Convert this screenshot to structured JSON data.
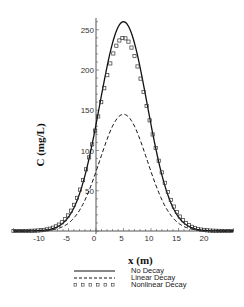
{
  "chart_data": {
    "type": "line",
    "title": "",
    "xlabel": "x (m)",
    "ylabel": "C (mg/L)",
    "xlim": [
      -15,
      25
    ],
    "ylim": [
      0,
      265
    ],
    "x_ticks": [
      -10,
      -5,
      0,
      5,
      10,
      15,
      20
    ],
    "y_ticks": [
      50,
      100,
      150,
      200,
      250
    ],
    "grid": false,
    "legend_position": "bottom",
    "series": [
      {
        "name": "No Decay",
        "style": "solid",
        "peak_x": 5,
        "peak_y": 260,
        "sigma": 4.3
      },
      {
        "name": "Linear Decay",
        "style": "dashed",
        "peak_x": 5,
        "peak_y": 145,
        "sigma": 4.3
      },
      {
        "name": "Nonlinear Decay",
        "style": "square-markers",
        "peak_x": 5,
        "peak_y": 240,
        "sigma": 4.5
      }
    ]
  },
  "axis": {
    "x_label": "x (m)",
    "y_label": "C (mg/L)",
    "x_tick_labels": [
      "-10",
      "-5",
      "0",
      "5",
      "10",
      "15",
      "20"
    ],
    "y_tick_labels": [
      "50",
      "100",
      "150",
      "200",
      "250"
    ]
  },
  "legend": {
    "items": [
      {
        "label": "No Decay"
      },
      {
        "label": "Linear Decay"
      },
      {
        "label": "Nonlinear Decay"
      }
    ]
  }
}
